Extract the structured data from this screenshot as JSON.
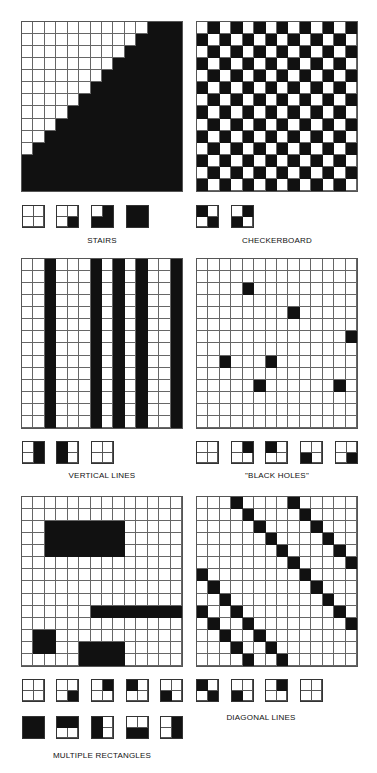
{
  "colors": {
    "fill": "#111111",
    "empty": "#ffffff",
    "gridline": "#666666"
  },
  "panels": [
    {
      "id": "stairs",
      "label": "STAIRS",
      "grid": {
        "x": 21,
        "y": 21,
        "w": 162,
        "h": 171,
        "rows": 14,
        "cols": 14,
        "pattern": "stairs"
      },
      "label_pos": {
        "x": 21,
        "y": 236,
        "w": 162
      },
      "tiles_y": 205,
      "tiles": [
        {
          "x": 22,
          "cells": [
            0,
            0,
            0,
            0
          ]
        },
        {
          "x": 56,
          "cells": [
            0,
            0,
            0,
            1
          ]
        },
        {
          "x": 91,
          "cells": [
            0,
            1,
            1,
            1
          ]
        },
        {
          "x": 126,
          "cells": [
            1,
            1,
            1,
            1
          ]
        }
      ]
    },
    {
      "id": "checkerboard",
      "label": "CHECKERBOARD",
      "grid": {
        "x": 196,
        "y": 21,
        "w": 162,
        "h": 171,
        "rows": 14,
        "cols": 14,
        "pattern": "checker"
      },
      "label_pos": {
        "x": 196,
        "y": 236,
        "w": 162
      },
      "tiles_y": 205,
      "tiles": [
        {
          "x": 196,
          "cells": [
            1,
            0,
            0,
            1
          ]
        },
        {
          "x": 231,
          "cells": [
            0,
            1,
            1,
            0
          ]
        }
      ]
    },
    {
      "id": "vertical-lines",
      "label": "VERTICAL LINES",
      "grid": {
        "x": 21,
        "y": 258,
        "w": 162,
        "h": 171,
        "rows": 14,
        "cols": 14,
        "pattern": "columns",
        "black_cols": [
          2,
          6,
          8,
          10,
          13
        ]
      },
      "label_pos": {
        "x": 21,
        "y": 471,
        "w": 162
      },
      "tiles_y": 441,
      "tiles": [
        {
          "x": 22,
          "cells": [
            0,
            1,
            0,
            1
          ]
        },
        {
          "x": 56,
          "cells": [
            1,
            0,
            1,
            0
          ]
        },
        {
          "x": 91,
          "cells": [
            0,
            0,
            0,
            0
          ]
        }
      ]
    },
    {
      "id": "black-holes",
      "label": "\"BLACK HOLES\"",
      "grid": {
        "x": 196,
        "y": 258,
        "w": 162,
        "h": 171,
        "rows": 14,
        "cols": 14,
        "pattern": "cells",
        "black_cells": [
          [
            2,
            4
          ],
          [
            4,
            8
          ],
          [
            6,
            13
          ],
          [
            8,
            2
          ],
          [
            8,
            6
          ],
          [
            10,
            5
          ],
          [
            10,
            12
          ]
        ]
      },
      "label_pos": {
        "x": 196,
        "y": 471,
        "w": 162
      },
      "tiles_y": 441,
      "tiles": [
        {
          "x": 196,
          "cells": [
            0,
            0,
            0,
            0
          ]
        },
        {
          "x": 231,
          "cells": [
            0,
            1,
            0,
            0
          ]
        },
        {
          "x": 265,
          "cells": [
            1,
            0,
            0,
            0
          ]
        },
        {
          "x": 300,
          "cells": [
            0,
            0,
            1,
            0
          ]
        },
        {
          "x": 335,
          "cells": [
            0,
            0,
            0,
            1
          ]
        }
      ]
    },
    {
      "id": "multiple-rectangles",
      "label": "MULTIPLE RECTANGLES",
      "grid": {
        "x": 21,
        "y": 496,
        "w": 162,
        "h": 171,
        "rows": 14,
        "cols": 14,
        "pattern": "cells",
        "black_rects": [
          [
            2,
            2,
            3,
            7
          ],
          [
            9,
            6,
            1,
            8
          ],
          [
            11,
            1,
            2,
            2
          ],
          [
            12,
            5,
            2,
            4
          ]
        ]
      },
      "label_pos": {
        "x": 21,
        "y": 751,
        "w": 162
      },
      "tiles_y": 679,
      "tiles": [
        {
          "x": 22,
          "cells": [
            0,
            0,
            0,
            0
          ]
        },
        {
          "x": 56,
          "cells": [
            0,
            0,
            0,
            1
          ]
        },
        {
          "x": 91,
          "cells": [
            0,
            1,
            0,
            0
          ]
        },
        {
          "x": 126,
          "cells": [
            1,
            0,
            0,
            0
          ]
        },
        {
          "x": 160,
          "cells": [
            0,
            0,
            1,
            0
          ]
        }
      ],
      "tiles2_y": 716,
      "tiles2": [
        {
          "x": 22,
          "cells": [
            1,
            1,
            1,
            1
          ]
        },
        {
          "x": 56,
          "cells": [
            1,
            1,
            0,
            0
          ]
        },
        {
          "x": 91,
          "cells": [
            1,
            0,
            1,
            0
          ]
        },
        {
          "x": 126,
          "cells": [
            0,
            0,
            1,
            1
          ]
        },
        {
          "x": 160,
          "cells": [
            0,
            1,
            0,
            1
          ]
        }
      ]
    },
    {
      "id": "diagonal-lines",
      "label": "DIAGONAL LINES",
      "grid": {
        "x": 196,
        "y": 496,
        "w": 162,
        "h": 171,
        "rows": 14,
        "cols": 14,
        "pattern": "cells",
        "black_cells": [
          [
            0,
            3
          ],
          [
            1,
            4
          ],
          [
            2,
            5
          ],
          [
            3,
            6
          ],
          [
            4,
            7
          ],
          [
            5,
            8
          ],
          [
            6,
            9
          ],
          [
            7,
            10
          ],
          [
            8,
            11
          ],
          [
            9,
            12
          ],
          [
            10,
            13
          ],
          [
            0,
            8
          ],
          [
            1,
            9
          ],
          [
            2,
            10
          ],
          [
            3,
            11
          ],
          [
            4,
            12
          ],
          [
            5,
            13
          ],
          [
            6,
            0
          ],
          [
            7,
            1
          ],
          [
            8,
            2
          ],
          [
            9,
            3
          ],
          [
            10,
            4
          ],
          [
            11,
            5
          ],
          [
            12,
            6
          ],
          [
            13,
            7
          ],
          [
            9,
            0
          ],
          [
            10,
            1
          ],
          [
            11,
            2
          ],
          [
            12,
            3
          ],
          [
            13,
            4
          ]
        ]
      },
      "label_pos": {
        "x": 196,
        "y": 713,
        "w": 130
      },
      "tiles_y": 679,
      "tiles": [
        {
          "x": 196,
          "cells": [
            1,
            0,
            0,
            1
          ]
        },
        {
          "x": 231,
          "cells": [
            0,
            0,
            1,
            0
          ]
        },
        {
          "x": 265,
          "cells": [
            0,
            1,
            0,
            0
          ]
        },
        {
          "x": 300,
          "cells": [
            0,
            0,
            0,
            0
          ]
        }
      ]
    }
  ]
}
